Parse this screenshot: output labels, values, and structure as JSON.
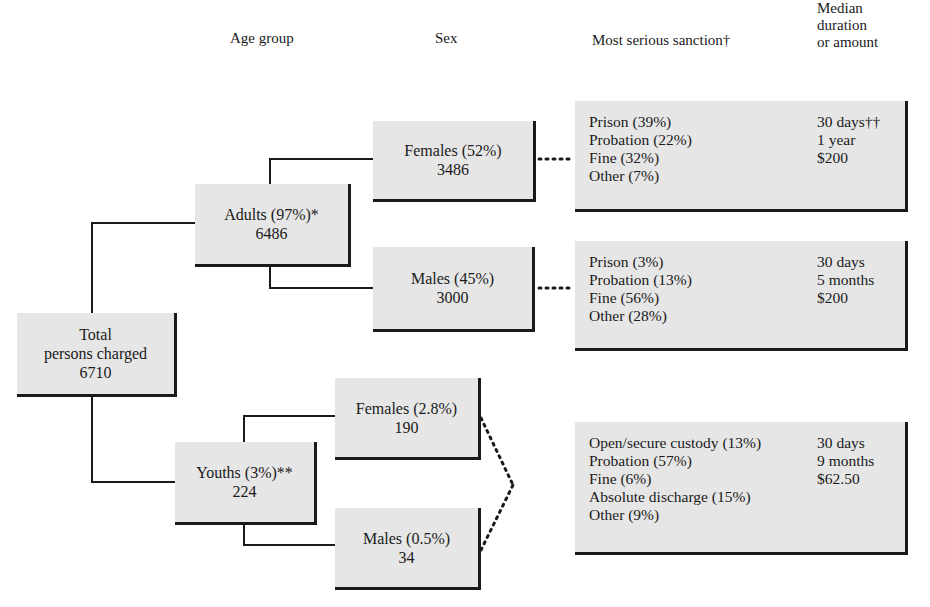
{
  "headers": {
    "age_group": "Age group",
    "sex": "Sex",
    "sanction": "Most serious sanction†",
    "median": [
      "Median",
      "duration",
      "or amount"
    ]
  },
  "total": {
    "line1": "Total",
    "line2": "persons charged",
    "count": "6710"
  },
  "adults": {
    "label": "Adults (97%)*",
    "count": "6486",
    "females": {
      "label": "Females (52%)",
      "count": "3486"
    },
    "males": {
      "label": "Males (45%)",
      "count": "3000"
    }
  },
  "youths": {
    "label": "Youths (3%)**",
    "count": "224",
    "females": {
      "label": "Females (2.8%)",
      "count": "190"
    },
    "males": {
      "label": "Males (0.5%)",
      "count": "34"
    }
  },
  "sanctions": {
    "adult_females": [
      {
        "label": "Prison (39%)",
        "value": "30 days††"
      },
      {
        "label": "Probation (22%)",
        "value": "1 year"
      },
      {
        "label": "Fine (32%)",
        "value": "$200"
      },
      {
        "label": "Other (7%)",
        "value": ""
      }
    ],
    "adult_males": [
      {
        "label": "Prison (3%)",
        "value": "30 days"
      },
      {
        "label": "Probation (13%)",
        "value": "5 months"
      },
      {
        "label": "Fine (56%)",
        "value": "$200"
      },
      {
        "label": "Other (28%)",
        "value": ""
      }
    ],
    "youths": [
      {
        "label": "Open/secure custody (13%)",
        "value": "30 days"
      },
      {
        "label": "Probation (57%)",
        "value": "9 months"
      },
      {
        "label": "Fine (6%)",
        "value": "$62.50"
      },
      {
        "label": "Absolute discharge (15%)",
        "value": ""
      },
      {
        "label": "Other (9%)",
        "value": ""
      }
    ]
  },
  "colors": {
    "box_fill": "#e6e6e6",
    "line": "#1a1a1a",
    "background": "#ffffff"
  }
}
